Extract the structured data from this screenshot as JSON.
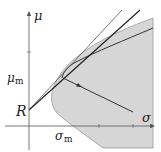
{
  "diagram": {
    "title": "",
    "labels": {
      "y_axis": "μ",
      "x_axis": "σ",
      "intercept": "R",
      "mu_m_main": "μ",
      "mu_m_sub": "m",
      "sigma_m_main": "σ",
      "sigma_m_sub": "m"
    },
    "colors": {
      "region_fill": "#d6d6d6",
      "region_edge": "#9a9a9a",
      "axis": "#555555",
      "line": "#222222",
      "thin_line": "#444444"
    },
    "elements": [
      "feasible-region",
      "efficient-frontier",
      "capital-market-line",
      "tangent-line",
      "trajectory-arrow"
    ]
  }
}
